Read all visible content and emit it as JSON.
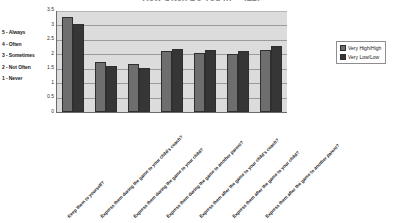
{
  "chart_data": {
    "type": "bar",
    "title": "How Often Do You (n = 422)",
    "xlabel": "",
    "ylabel": "",
    "ylim": [
      0,
      3.5
    ],
    "yticks": [
      "3.5",
      "3",
      "2.5",
      "2",
      "1.5",
      "1",
      "0.5",
      "0"
    ],
    "grid": true,
    "legend_position": "right",
    "categories": [
      "Keep them to yourself?",
      "Express them during the game to your child's coach?",
      "Express them during the game to your child?",
      "Express them during the game to another parent?",
      "Express them after the game to your child's coach?",
      "Express them after the game to your child?",
      "Express them after the game to another parent?"
    ],
    "series": [
      {
        "name": "Very High/High",
        "values": [
          3.3,
          1.75,
          1.65,
          2.1,
          2.05,
          2.0,
          2.15
        ]
      },
      {
        "name": "Very Low/Low",
        "values": [
          3.05,
          1.6,
          1.52,
          2.2,
          2.15,
          2.1,
          2.3
        ]
      }
    ]
  },
  "scale_key": {
    "items": [
      "5 - Always",
      "4 - Often",
      "3 - Sometimes",
      "2 - Not Often",
      "1 - Never"
    ]
  }
}
